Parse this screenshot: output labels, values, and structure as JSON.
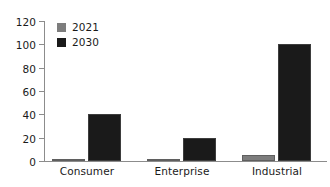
{
  "chart_data": {
    "type": "bar",
    "title": "",
    "subtitle": "",
    "xlabel": "",
    "ylabel": "",
    "categories": [
      "Consumer",
      "Enterprise",
      "Industrial"
    ],
    "series": [
      {
        "name": "2021",
        "color": "#7d7d7d",
        "values": [
          1.5,
          1,
          5
        ]
      },
      {
        "name": "2030",
        "color": "#1a1a1a",
        "values": [
          40,
          20,
          100
        ]
      }
    ],
    "ylim": [
      0,
      120
    ],
    "ytick_labels": [
      "0",
      "20",
      "40",
      "60",
      "80",
      "100",
      "120"
    ],
    "ytick_values": [
      0,
      20,
      40,
      60,
      80,
      100,
      120
    ],
    "grid": false,
    "legend_position": "top-left-inside",
    "legend_entries": [
      "2021",
      "2030"
    ],
    "annotations": []
  },
  "axes": {
    "y_ticks": [
      {
        "label": "120",
        "value": 120
      },
      {
        "label": "100",
        "value": 100
      },
      {
        "label": "80",
        "value": 80
      },
      {
        "label": "60",
        "value": 60
      },
      {
        "label": "40",
        "value": 40
      },
      {
        "label": "20",
        "value": 20
      },
      {
        "label": "0",
        "value": 0
      }
    ],
    "x_ticks": [
      {
        "label": "Consumer"
      },
      {
        "label": "Enterprise"
      },
      {
        "label": "Industrial"
      }
    ]
  },
  "legend": {
    "items": [
      {
        "label": "2021",
        "color": "#7d7d7d"
      },
      {
        "label": "2030",
        "color": "#1a1a1a"
      }
    ]
  },
  "bars": [
    {
      "group": "Consumer",
      "series": "2021",
      "value": 1.5
    },
    {
      "group": "Consumer",
      "series": "2030",
      "value": 40
    },
    {
      "group": "Enterprise",
      "series": "2021",
      "value": 1
    },
    {
      "group": "Enterprise",
      "series": "2030",
      "value": 20
    },
    {
      "group": "Industrial",
      "series": "2021",
      "value": 5
    },
    {
      "group": "Industrial",
      "series": "2030",
      "value": 100
    }
  ],
  "colors": {
    "series_2021": "#7d7d7d",
    "series_2030": "#1a1a1a",
    "axis": "#8c8c8c",
    "text": "#1a1a1a",
    "background": "#ffffff"
  }
}
